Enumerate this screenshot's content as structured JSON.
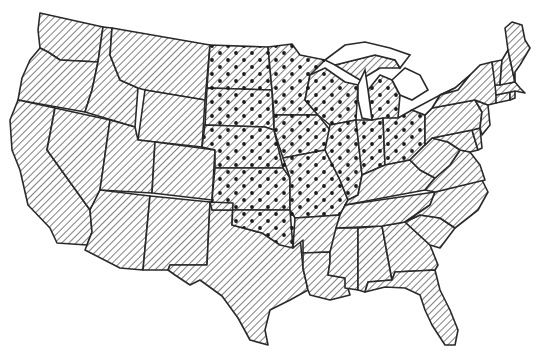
{
  "map": {
    "title": "Contiguous United States",
    "style": "black-and-white line map",
    "colors": {
      "background": "#ffffff",
      "outline": "#2a2a2a",
      "hatch": "#3a3a3a",
      "dot": "#1a1a1a"
    },
    "legend": {
      "hatched": "All states (diagonal hatching)",
      "dotted": "Highlighted region (hatching with dots)"
    },
    "regions": {
      "hatched_only": [
        "WA",
        "OR",
        "CA",
        "ID",
        "NV",
        "MT",
        "WY",
        "UT",
        "AZ",
        "CO",
        "NM",
        "TX",
        "LA",
        "AR",
        "MS",
        "AL",
        "GA",
        "FL",
        "SC",
        "NC",
        "TN",
        "KY",
        "VA",
        "WV",
        "MD",
        "DE",
        "PA",
        "NJ",
        "NY",
        "CT",
        "RI",
        "MA",
        "VT",
        "NH",
        "ME"
      ],
      "dotted": [
        "ND",
        "SD",
        "NE",
        "KS",
        "OK",
        "MN",
        "IA",
        "MO",
        "WI",
        "IL",
        "MI",
        "IN",
        "OH"
      ]
    }
  }
}
